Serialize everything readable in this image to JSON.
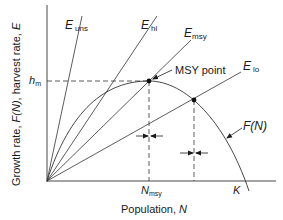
{
  "diagram": {
    "title": "",
    "y_axis_label": "Growth rate, F(N), harvest rate, E",
    "y_axis_label_parts": {
      "a": "Growth rate, ",
      "b": "F(N)",
      "c": ", harvest rate, ",
      "d": "E"
    },
    "x_axis_label_parts": {
      "a": "Population, ",
      "b": "N"
    },
    "hm_label": {
      "main": "h",
      "sub": "m"
    },
    "nmsy_label": {
      "main": "N",
      "sub": "msy"
    },
    "k_label": "K",
    "curve_label": "F(N)",
    "msy_point_label": "MSY point",
    "harvest_lines": [
      {
        "main": "E",
        "sub": "uns"
      },
      {
        "main": "E",
        "sub": "hi"
      },
      {
        "main": "E",
        "sub": "msy"
      },
      {
        "main": "E",
        "sub": "lo"
      }
    ],
    "colors": {
      "line": "#2a2a2a",
      "background": "#ffffff"
    }
  }
}
